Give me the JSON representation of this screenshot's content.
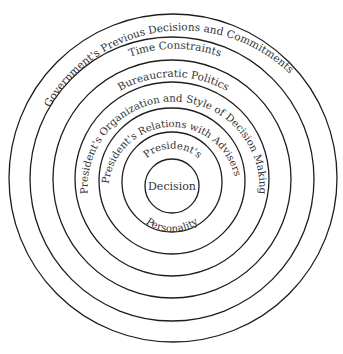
{
  "diagram": {
    "type": "concentric-circles",
    "center_label": "Decision",
    "rings": [
      {
        "level": 1,
        "label": "Decision"
      },
      {
        "level": 2,
        "label_top": "President's",
        "label_bottom": "Personality"
      },
      {
        "level": 3,
        "label": "President's Relations with Advisers"
      },
      {
        "level": 4,
        "label": "President's Organization and Style of Decision Making"
      },
      {
        "level": 5,
        "label": "Bureaucratic Politics"
      },
      {
        "level": 6,
        "label": "Time Constraints"
      },
      {
        "level": 7,
        "label": "Government's Previous Decisions and Commitments"
      }
    ],
    "colors": {
      "stroke": "#1e1e1e",
      "text": "#333333",
      "background": "#ffffff"
    }
  }
}
